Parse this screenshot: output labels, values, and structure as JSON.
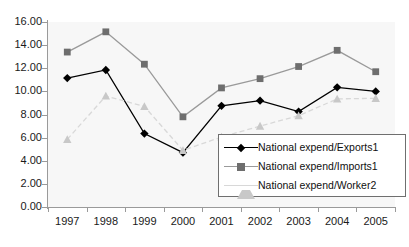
{
  "title": {
    "cropped_text": "",
    "visible": false
  },
  "axes": {
    "y": {
      "min": 0,
      "max": 16,
      "step": 2,
      "ticks": [
        "0.00",
        "2.00",
        "4.00",
        "6.00",
        "8.00",
        "10.00",
        "12.00",
        "14.00",
        "16.00"
      ],
      "label": ""
    },
    "x": {
      "ticks": [
        "1997",
        "1998",
        "1999",
        "2000",
        "2001",
        "2002",
        "2003",
        "2004",
        "2005"
      ],
      "label": ""
    }
  },
  "legend": {
    "position": "inside-bottom-right",
    "bordered": true,
    "entries": [
      {
        "label": "National expend/Exports1",
        "marker": "diamond",
        "color": "#000000"
      },
      {
        "label": "National expend/Imports1",
        "marker": "square",
        "color": "#6e6e6e"
      },
      {
        "label": "National expend/Worker2",
        "marker": "triangle",
        "color": "#c8c8c8"
      }
    ]
  },
  "chart_data": {
    "type": "line",
    "title": "",
    "xlabel": "",
    "ylabel": "",
    "ylim": [
      0,
      16
    ],
    "ytick_step": 2,
    "grid": false,
    "legend_position": "inside-bottom-right",
    "categories": [
      "1997",
      "1998",
      "1999",
      "2000",
      "2001",
      "2002",
      "2003",
      "2004",
      "2005"
    ],
    "series": [
      {
        "name": "National expend/Exports1",
        "marker": "diamond",
        "color": "#000000",
        "line_color": "#000000",
        "line_style": "solid",
        "values": [
          11.15,
          11.85,
          6.35,
          4.7,
          8.75,
          9.2,
          8.25,
          10.35,
          10.0
        ]
      },
      {
        "name": "National expend/Imports1",
        "marker": "square",
        "color": "#6e6e6e",
        "line_color": "#9a9a9a",
        "line_style": "solid",
        "values": [
          13.4,
          15.15,
          12.35,
          7.8,
          10.3,
          11.1,
          12.15,
          13.55,
          11.7
        ]
      },
      {
        "name": "National expend/Worker2",
        "marker": "triangle",
        "color": "#c8c8c8",
        "line_color": "#d8d8d8",
        "line_style": "dashed",
        "values": [
          5.85,
          9.6,
          8.7,
          4.9,
          6.05,
          7.0,
          7.9,
          9.35,
          9.4
        ]
      }
    ]
  }
}
